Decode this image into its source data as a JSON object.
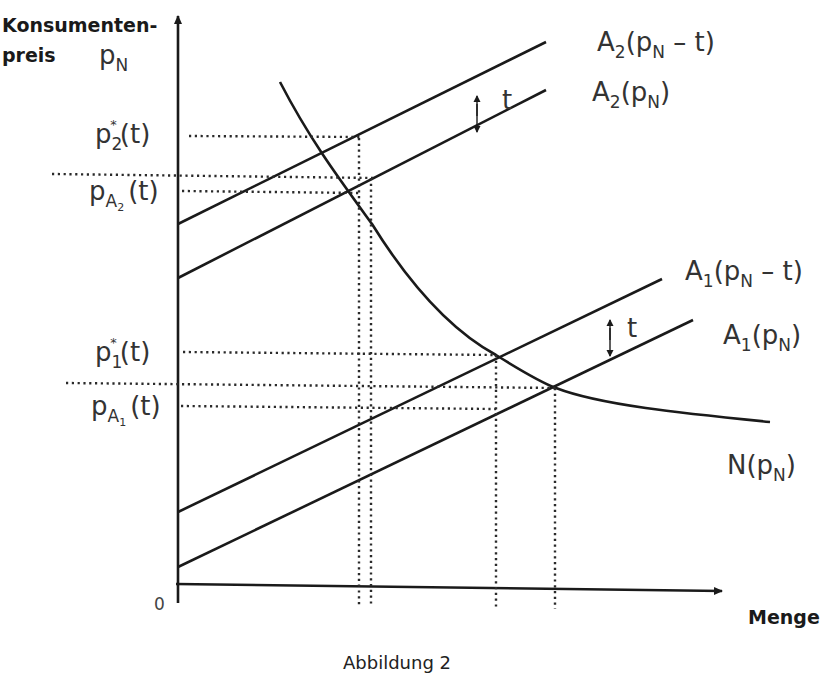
{
  "figure": {
    "caption": "Abbildung 2",
    "y_axis_label_line1": "Konsumenten-",
    "y_axis_label_line2": "preis",
    "y_axis_symbol": "p",
    "y_axis_symbol_sub": "N",
    "x_axis_label": "Menge",
    "origin_label": "0"
  },
  "y_ticks": [
    {
      "id": "p2-star",
      "base": "p",
      "sub": "2",
      "sup": "*",
      "arg": "(t)"
    },
    {
      "id": "pA2",
      "base": "p",
      "sub": "A",
      "subsub": "2",
      "arg": "(t)"
    },
    {
      "id": "p1-star",
      "base": "p",
      "sub": "1",
      "sup": "*",
      "arg": "(t)"
    },
    {
      "id": "pA1",
      "base": "p",
      "sub": "A",
      "subsub": "1",
      "arg": "(t)"
    }
  ],
  "curves": [
    {
      "id": "A2-shifted",
      "name": "A",
      "sub": "2",
      "arg_open": "(p",
      "arg_sub": "N",
      "arg_close": " – t)"
    },
    {
      "id": "A2",
      "name": "A",
      "sub": "2",
      "arg_open": "(p",
      "arg_sub": "N",
      "arg_close": ")"
    },
    {
      "id": "A1-shifted",
      "name": "A",
      "sub": "1",
      "arg_open": "(p",
      "arg_sub": "N",
      "arg_close": " – t)"
    },
    {
      "id": "A1",
      "name": "A",
      "sub": "1",
      "arg_open": "(p",
      "arg_sub": "N",
      "arg_close": ")"
    },
    {
      "id": "N",
      "name": "N",
      "sub": "",
      "arg_open": "(p",
      "arg_sub": "N",
      "arg_close": ")"
    }
  ],
  "shift_labels": {
    "upper": "t",
    "lower": "t"
  },
  "colors": {
    "line": "#1a1a1a",
    "text": "#2a2a2a",
    "background": "#ffffff"
  }
}
